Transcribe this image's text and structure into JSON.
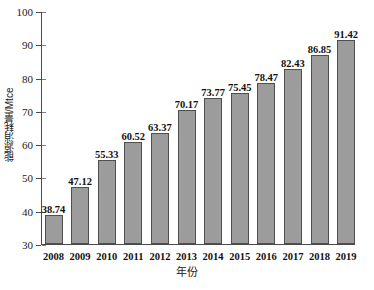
{
  "chart_data": {
    "type": "bar",
    "title": "",
    "xlabel": "年份",
    "ylabel": "能源消耗量/Mtce",
    "categories": [
      "2008",
      "2009",
      "2010",
      "2011",
      "2012",
      "2013",
      "2014",
      "2015",
      "2016",
      "2017",
      "2018",
      "2019"
    ],
    "values": [
      38.74,
      47.12,
      55.33,
      60.52,
      63.37,
      70.17,
      73.77,
      75.45,
      78.47,
      82.43,
      86.85,
      91.42
    ],
    "value_labels": [
      "38.74",
      "47.12",
      "55.33",
      "60.52",
      "63.37",
      "70.17",
      "73.77",
      "75.45",
      "78.47",
      "82.43",
      "86.85",
      "91.42"
    ],
    "ylim": [
      30,
      100
    ],
    "ytick_labels": [
      "30",
      "40",
      "50",
      "60",
      "70",
      "80",
      "90",
      "100"
    ],
    "ytick_values": [
      30,
      40,
      50,
      60,
      70,
      80,
      90,
      100
    ],
    "grid": false,
    "legend": null,
    "series_color": "#9c9c9c",
    "series_edge_color": "#4f4f4f",
    "axis_color": "#4a4a4a"
  }
}
